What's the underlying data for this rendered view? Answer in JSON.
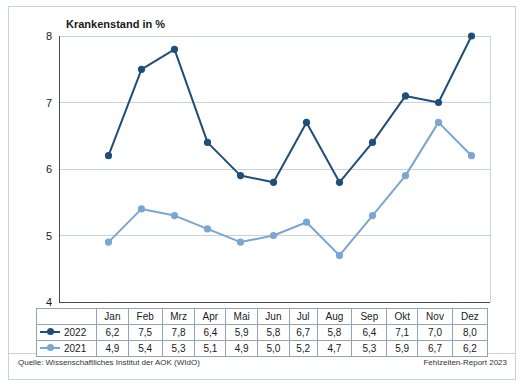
{
  "chart_data": {
    "type": "line",
    "title": "Krankenstand in %",
    "categories": [
      "Jan",
      "Feb",
      "Mrz",
      "Apr",
      "Mai",
      "Jun",
      "Jul",
      "Aug",
      "Sep",
      "Okt",
      "Nov",
      "Dez"
    ],
    "series": [
      {
        "name": "2022",
        "values": [
          6.2,
          7.5,
          7.8,
          6.4,
          5.9,
          5.8,
          6.7,
          5.8,
          6.4,
          7.1,
          7.0,
          8.0
        ],
        "color": "#1f4e79"
      },
      {
        "name": "2021",
        "values": [
          4.9,
          5.4,
          5.3,
          5.1,
          4.9,
          5.0,
          5.2,
          4.7,
          5.3,
          5.9,
          6.7,
          6.2
        ],
        "color": "#7aa6d2"
      }
    ],
    "labels": {
      "2022": [
        "6,2",
        "7,5",
        "7,8",
        "6,4",
        "5,9",
        "5,8",
        "6,7",
        "5,8",
        "6,4",
        "7,1",
        "7,0",
        "8,0"
      ],
      "2021": [
        "4,9",
        "5,4",
        "5,3",
        "5,1",
        "4,9",
        "5,0",
        "5,2",
        "4,7",
        "5,3",
        "5,9",
        "6,7",
        "6,2"
      ]
    },
    "yticks": [
      "4",
      "5",
      "6",
      "7",
      "8"
    ],
    "ylim": [
      4,
      8
    ],
    "xlabel": "",
    "ylabel": "",
    "grid": true,
    "legend_position": "table-left"
  },
  "footer": {
    "source": "Quelle: Wissenschaftliches Institut der AOK (WIdO)",
    "report": "Fehlzeiten-Report 2023"
  }
}
